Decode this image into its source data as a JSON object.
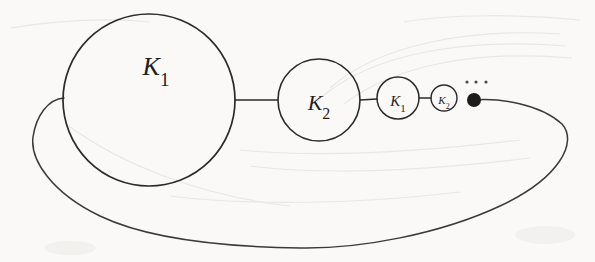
{
  "figure": {
    "background_color": "#fdfdfc",
    "ink_color": "#2b2b2b",
    "ellipsis_text": "...",
    "nodes": [
      {
        "id": "node-1",
        "label_base": "K",
        "label_sub": "1",
        "cx": 149,
        "cy": 100,
        "r": 86,
        "label_x": 156,
        "label_y": 75,
        "font_size": 26
      },
      {
        "id": "node-2",
        "label_base": "K",
        "label_sub": "2",
        "cx": 319,
        "cy": 100,
        "r": 41,
        "label_x": 319,
        "label_y": 110,
        "font_size": 22
      },
      {
        "id": "node-3",
        "label_base": "K",
        "label_sub": "1",
        "cx": 398,
        "cy": 98,
        "r": 21,
        "label_x": 398,
        "label_y": 106,
        "font_size": 15
      },
      {
        "id": "node-4",
        "label_base": "K",
        "label_sub": "2",
        "cx": 444,
        "cy": 98,
        "r": 13,
        "label_x": 444,
        "label_y": 104,
        "font_size": 11
      }
    ],
    "edges": [
      {
        "id": "edge-1-2",
        "x1": 235,
        "y1": 100,
        "x2": 278,
        "y2": 100
      },
      {
        "id": "edge-2-3",
        "x1": 360,
        "y1": 100,
        "x2": 377,
        "y2": 99
      },
      {
        "id": "edge-3-4",
        "x1": 419,
        "y1": 98,
        "x2": 431,
        "y2": 98
      }
    ],
    "terminal_dot": {
      "cx": 474,
      "cy": 100,
      "r": 7
    },
    "ellipsis_dots": [
      {
        "cx": 467,
        "cy": 82,
        "r": 1.6
      },
      {
        "cx": 476,
        "cy": 82,
        "r": 1.6
      },
      {
        "cx": 486,
        "cy": 82,
        "r": 1.6
      }
    ],
    "loop_path": "M 474 100 C 500 98 540 104 562 124 C 578 142 560 178 500 206 C 440 234 360 249 300 248 C 230 247 150 240 100 216 C 52 193 30 160 33 137 C 36 116 48 99 64 98",
    "label_font_family": "Liberation Serif"
  }
}
